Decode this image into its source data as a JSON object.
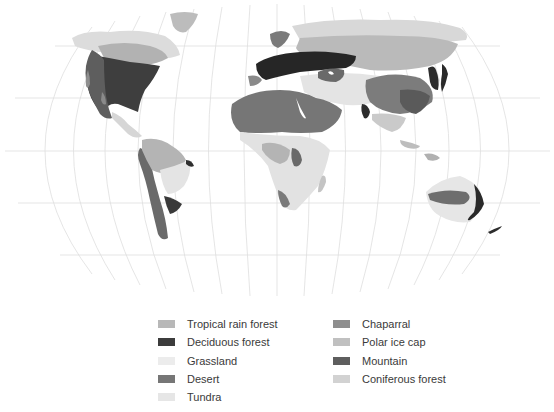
{
  "map": {
    "title": "World biomes",
    "projection": "Robinson-like pseudocylindrical with graticule",
    "graticule_color": "#dcdcdc",
    "background": "#ffffff"
  },
  "legend": {
    "left_column": [
      {
        "label": "Tropical rain forest",
        "color": "#b8b8b8"
      },
      {
        "label": "Deciduous forest",
        "color": "#3c3c3c"
      },
      {
        "label": "Grassland",
        "color": "#ececec"
      },
      {
        "label": "Desert",
        "color": "#767676"
      },
      {
        "label": "Tundra",
        "color": "#e6e6e6"
      }
    ],
    "right_column": [
      {
        "label": "Chaparral",
        "color": "#8e8e8e"
      },
      {
        "label": "Polar ice cap",
        "color": "#c0c0c0"
      },
      {
        "label": "Mountain",
        "color": "#5e5e5e"
      },
      {
        "label": "Coniferous forest",
        "color": "#d2d2d2"
      }
    ]
  }
}
